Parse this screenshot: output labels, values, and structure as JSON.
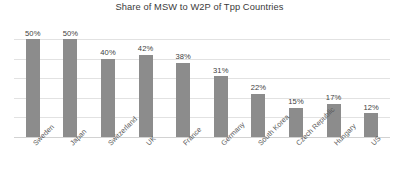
{
  "chart_data": {
    "type": "bar",
    "title": "Share of MSW to W2P of Tpp Countries",
    "xlabel": "",
    "ylabel": "",
    "ylim": [
      0,
      50
    ],
    "yticks": [
      0,
      10,
      20,
      30,
      40,
      50
    ],
    "y_tick_labels_shown": false,
    "grid": true,
    "legend": false,
    "orientation": "vertical",
    "bar_color": "#8c8c8c",
    "gridline_color": "#e2e2e2",
    "categories": [
      "Sweden",
      "Japan",
      "Switzerland",
      "UK",
      "France",
      "Germany",
      "South Korea",
      "Czech Republic",
      "Hungary",
      "US"
    ],
    "values": [
      50,
      50,
      40,
      42,
      38,
      31,
      22,
      15,
      17,
      12
    ],
    "data_labels": [
      "50%",
      "50%",
      "40%",
      "42%",
      "38%",
      "31%",
      "22%",
      "15%",
      "17%",
      "12%"
    ]
  }
}
